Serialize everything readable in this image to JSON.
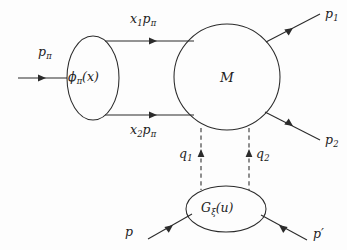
{
  "figure": {
    "type": "feynman-diagram",
    "background_color": "#fdfdfd",
    "line_color": "#2b2b2b"
  },
  "labels": {
    "incoming_pion": "p",
    "incoming_pion_sub": "π",
    "quark_upper": "x",
    "quark_upper_sub": "1",
    "quark_upper_tail": "p",
    "quark_upper_tail_sub": "π",
    "quark_lower": "x",
    "quark_lower_sub": "2",
    "quark_lower_tail": "p",
    "quark_lower_tail_sub": "π",
    "pion_blob": "ϕ",
    "pion_blob_sub": "π",
    "pion_blob_arg": "(x)",
    "hard_kernel": "M",
    "outgoing_1": "p",
    "outgoing_1_sub": "1",
    "outgoing_2": "p",
    "outgoing_2_sub": "2",
    "gluon_1": "q",
    "gluon_1_sub": "1",
    "gluon_2": "q",
    "gluon_2_sub": "2",
    "nucleon_blob": "G",
    "nucleon_blob_sub": "ξ",
    "nucleon_blob_arg": "(u)",
    "incoming_nucleon": "p",
    "outgoing_nucleon": "p",
    "outgoing_nucleon_prime": "′"
  },
  "geometry": {
    "pion_blob": {
      "cx": 93,
      "cy": 78,
      "rx": 26,
      "ry": 42
    },
    "hard_blob": {
      "cx": 227,
      "cy": 77,
      "r": 53
    },
    "nucleon_blob": {
      "cx": 226,
      "cy": 209,
      "rx": 40,
      "ry": 23
    }
  }
}
